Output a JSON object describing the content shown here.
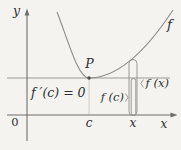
{
  "figure": {
    "type": "calculus-minimum-diagram",
    "colors": {
      "background": "#f4f3ef",
      "axis": "#6e6e6e",
      "curve": "#8a8a8a",
      "tangent": "#9c9c97",
      "guide": "#c4c2ba",
      "bracket": "#8f8f8b",
      "dot": "#4f4f4f",
      "text": "#2e2e2e"
    },
    "labels": {
      "y_axis": "y",
      "x_axis": "x",
      "origin": "0",
      "curve": "f",
      "point": "P",
      "c_coordinate": "c",
      "x_coordinate": "x",
      "derivative_equation": "f ′(c) = 0",
      "f_of_c": "f (c)",
      "f_of_x": "f (x)"
    }
  }
}
